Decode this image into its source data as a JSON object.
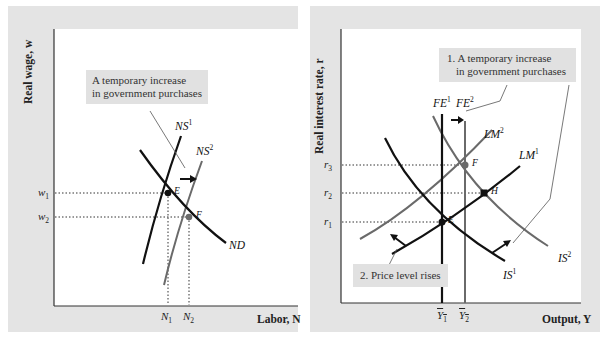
{
  "left_panel": {
    "y_axis_label": "Real wage, w",
    "x_axis_label": "Labor, N",
    "annotation": [
      "A temporary increase",
      "in government purchases"
    ],
    "y_ticks": [
      {
        "label": "w",
        "sub": "1"
      },
      {
        "label": "w",
        "sub": "2"
      }
    ],
    "x_ticks": [
      {
        "label": "N",
        "sub": "1"
      },
      {
        "label": "N",
        "sub": "2"
      }
    ],
    "curves": {
      "ns1": {
        "label": "NS",
        "sup": "1"
      },
      "ns2": {
        "label": "NS",
        "sup": "2"
      },
      "nd": {
        "label": "ND"
      }
    },
    "points": {
      "e": "E",
      "f": "F"
    }
  },
  "right_panel": {
    "y_axis_label": "Real interest rate, r",
    "x_axis_label": "Output, Y",
    "annotation_1": [
      "1. A temporary increase",
      "in government purchases"
    ],
    "annotation_2": "2. Price level rises",
    "y_ticks": [
      {
        "label": "r",
        "sub": "3"
      },
      {
        "label": "r",
        "sub": "2"
      },
      {
        "label": "r",
        "sub": "1"
      }
    ],
    "x_ticks": [
      {
        "label": "Y",
        "sub": "1"
      },
      {
        "label": "Y",
        "sub": "2"
      }
    ],
    "curves": {
      "fe1": {
        "label": "FE",
        "sup": "1"
      },
      "fe2": {
        "label": "FE",
        "sup": "2"
      },
      "lm1": {
        "label": "LM",
        "sup": "1"
      },
      "lm2": {
        "label": "LM",
        "sup": "2"
      },
      "is1": {
        "label": "IS",
        "sup": "1"
      },
      "is2": {
        "label": "IS",
        "sup": "2"
      }
    },
    "points": {
      "e": "E",
      "f": "F",
      "h": "H"
    }
  },
  "colors": {
    "panel_bg": "#e4e4e4",
    "plot_bg": "#ffffff",
    "initial_curve": "#111111",
    "shifted_curve": "#6a6a6a",
    "annotation_bg": "#e1e1e1"
  }
}
